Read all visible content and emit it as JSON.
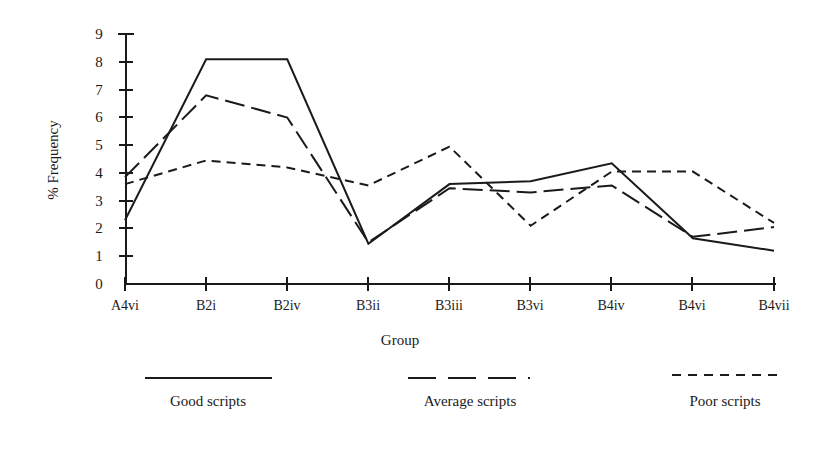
{
  "chart_data": {
    "type": "line",
    "title": "",
    "xlabel": "Group",
    "ylabel": "% Frequency",
    "categories": [
      "A4vi",
      "B2i",
      "B2iv",
      "B3ii",
      "B3iii",
      "B3vi",
      "B4iv",
      "B4vi",
      "B4vii"
    ],
    "ylim": [
      0,
      9
    ],
    "yticks": [
      0,
      1,
      2,
      3,
      4,
      5,
      6,
      7,
      8,
      9
    ],
    "ytick_labels": [
      "0",
      "1",
      "2",
      "3",
      "4",
      "5",
      "6",
      "7",
      "8",
      "9"
    ],
    "grid": false,
    "legend_position": "below",
    "series": [
      {
        "name": "Good scripts",
        "style": "solid",
        "values": [
          2.3,
          8.1,
          8.1,
          1.45,
          3.6,
          3.7,
          4.35,
          1.65,
          1.2
        ]
      },
      {
        "name": "Average scripts",
        "style": "long-dash",
        "values": [
          3.85,
          6.8,
          6.0,
          1.5,
          3.45,
          3.3,
          3.55,
          1.7,
          2.05
        ]
      },
      {
        "name": "Poor scripts",
        "style": "short-dash",
        "values": [
          3.6,
          4.45,
          4.2,
          3.55,
          4.95,
          2.1,
          4.05,
          4.05,
          2.2
        ]
      }
    ]
  },
  "axes": {
    "y_axis_label": "% Frequency",
    "x_axis_label": "Group"
  },
  "legend": {
    "items": [
      {
        "label": "Good scripts",
        "style": "solid"
      },
      {
        "label": "Average scripts",
        "style": "long-dash"
      },
      {
        "label": "Poor scripts",
        "style": "short-dash"
      }
    ]
  }
}
